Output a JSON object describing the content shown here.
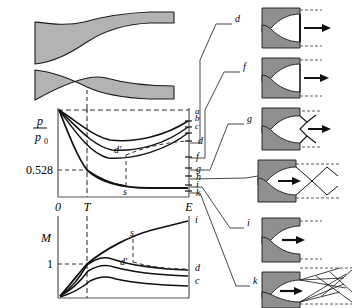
{
  "figure": {
    "fill_gray": "#b3b3b3",
    "stroke": "#1a1a1a",
    "dash_color": "#333333"
  },
  "nozzle_profile": {
    "name": "large-nozzle-cross-section",
    "throat_marker": "dashed-vertical"
  },
  "pressure_chart": {
    "axis_label_num": "p",
    "axis_label_den": "p",
    "axis_label_den_sub": "0",
    "ytick": "0.528",
    "xticks": [
      "0",
      "T",
      "E"
    ],
    "curve_end_labels": [
      "a",
      "b",
      "c",
      "d",
      "f",
      "g",
      "h",
      "i",
      "k"
    ],
    "annotations": [
      "d'",
      "s"
    ]
  },
  "mach_chart": {
    "axis_label": "M",
    "ytick": "1",
    "curve_end_labels": [
      "i",
      "d",
      "c"
    ],
    "annotations": [
      "s",
      "d'"
    ]
  },
  "nozzle_cases": [
    {
      "label": "d",
      "flow": "shock-at-exit-plane"
    },
    {
      "label": "f",
      "flow": "fully-expanded-arrow"
    },
    {
      "label": "g",
      "flow": "oblique-shock-lambda"
    },
    {
      "label": "h",
      "flow": "oblique-shock-diamond"
    },
    {
      "label": "i",
      "flow": "design-condition"
    },
    {
      "label": "k",
      "flow": "underexpanded-expansion-fan"
    }
  ],
  "leaders": [
    {
      "from": "d"
    },
    {
      "from": "f"
    },
    {
      "from": "g"
    },
    {
      "from": "h"
    },
    {
      "from": "i"
    },
    {
      "from": "k"
    }
  ]
}
